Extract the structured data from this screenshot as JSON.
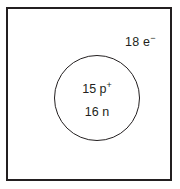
{
  "figure": {
    "title": "Atomic particle diagram",
    "background_color": "#ffffff",
    "line_color": "#231f20"
  },
  "electron_cloud": {
    "shape": "square",
    "label_count": "18",
    "label_symbol": "e",
    "label_charge": "−",
    "label_full": "18 e⁻"
  },
  "nucleus": {
    "shape": "circle",
    "proton_count": "15",
    "proton_symbol": "p",
    "proton_charge": "+",
    "proton_label_full": "15 p⁺",
    "neutron_count": "16",
    "neutron_symbol": "n",
    "neutron_label_full": "16 n"
  }
}
